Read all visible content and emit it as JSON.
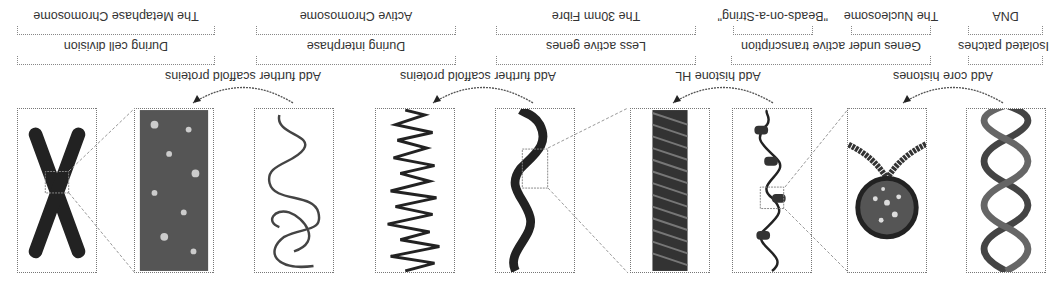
{
  "figure": {
    "orientation": "rotated-180",
    "stages": [
      {
        "id": "dna",
        "name": "DNA",
        "occurrence": "Isolated patches"
      },
      {
        "id": "nucleosome",
        "name": "The Nucleosome",
        "occurrence": "Genes under active transcription"
      },
      {
        "id": "beads",
        "name": "\"Beads-on-a-String\"",
        "occurrence": "Genes under active transcription"
      },
      {
        "id": "fibre30",
        "name": "The 30nm Fibre",
        "occurrence": "Less active genes"
      },
      {
        "id": "fibre30zoom",
        "name": "The 30nm Fibre",
        "occurrence": "Less active genes"
      },
      {
        "id": "active",
        "name": "Active Chromosome",
        "occurrence": "During interphase"
      },
      {
        "id": "activeloops",
        "name": "Active Chromosome",
        "occurrence": "During interphase"
      },
      {
        "id": "metaphase",
        "name": "The Metaphase Chromosome",
        "occurrence": "During cell division"
      },
      {
        "id": "metaphasex",
        "name": "The Metaphase Chromosome",
        "occurrence": "During cell division"
      }
    ],
    "steps": [
      {
        "label": "Add core histones"
      },
      {
        "label": "Add histone HL"
      },
      {
        "label": "Add further scaffold proteins"
      },
      {
        "label": "Add further scaffold proteins"
      }
    ],
    "name_labels": {
      "dna": "DNA",
      "nucleosome": "The Nucleosome",
      "beads": "\"Beads-on-a-String\"",
      "fibre": "The 30nm Fibre",
      "active": "Active Chromosome",
      "metaphase": "The Metaphase Chromosome"
    },
    "occurrence_labels": {
      "isolated": "Isolated patches",
      "transcription": "Genes under active transcription",
      "less_active": "Less active genes",
      "interphase": "During interphase",
      "cell_division": "During cell division"
    }
  }
}
